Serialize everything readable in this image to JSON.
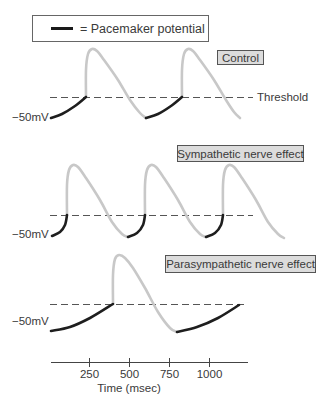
{
  "legend": {
    "label": "= Pacemaker potential",
    "swatch_color": "#1a1a1a"
  },
  "threshold_label": "Threshold",
  "colors": {
    "pacemaker": "#1e1e1e",
    "action_potential": "#c8c8c8",
    "threshold_dash": "#555555",
    "label_box_fill": "#dcdcdc",
    "label_box_stroke": "#555555",
    "axis": "#444444"
  },
  "panels": [
    {
      "title": "Control",
      "voltage_label": "−50mV",
      "label_box": {
        "x": 217,
        "y": 50,
        "w": 46,
        "h": 14
      },
      "voltage_label_y": 121,
      "threshold_y": 97,
      "threshold_x": [
        50,
        253
      ],
      "show_threshold_label": true,
      "pacemaker_segments": [
        [
          [
            51,
            118
          ],
          [
            62,
            114
          ],
          [
            75,
            106
          ],
          [
            86,
            97
          ]
        ],
        [
          [
            146,
            118
          ],
          [
            158,
            114
          ],
          [
            171,
            106
          ],
          [
            182,
            97
          ]
        ]
      ],
      "action_potentials": [
        [
          [
            86,
            97
          ],
          [
            86,
            70
          ],
          [
            88,
            54
          ],
          [
            92,
            49
          ],
          [
            97,
            51
          ],
          [
            104,
            60
          ],
          [
            118,
            80
          ],
          [
            130,
            100
          ],
          [
            140,
            113
          ],
          [
            146,
            118
          ]
        ],
        [
          [
            182,
            97
          ],
          [
            182,
            70
          ],
          [
            184,
            54
          ],
          [
            188,
            49
          ],
          [
            193,
            51
          ],
          [
            200,
            60
          ],
          [
            214,
            80
          ],
          [
            226,
            100
          ],
          [
            234,
            112
          ],
          [
            240,
            118
          ]
        ]
      ]
    },
    {
      "title": "Sympathetic nerve effect",
      "voltage_label": "−50mV",
      "label_box": {
        "x": 177,
        "y": 145,
        "w": 126,
        "h": 16
      },
      "voltage_label_y": 238,
      "threshold_y": 215,
      "threshold_x": [
        50,
        253
      ],
      "show_threshold_label": false,
      "pacemaker_segments": [
        [
          [
            52,
            236
          ],
          [
            60,
            232
          ],
          [
            65,
            225
          ],
          [
            67,
            215
          ]
        ],
        [
          [
            128,
            237
          ],
          [
            137,
            233
          ],
          [
            143,
            225
          ],
          [
            145,
            215
          ]
        ],
        [
          [
            206,
            237
          ],
          [
            215,
            233
          ],
          [
            221,
            225
          ],
          [
            223,
            215
          ]
        ]
      ],
      "action_potentials": [
        [
          [
            67,
            215
          ],
          [
            67,
            185
          ],
          [
            69,
            170
          ],
          [
            73,
            165
          ],
          [
            78,
            167
          ],
          [
            86,
            178
          ],
          [
            100,
            200
          ],
          [
            112,
            222
          ],
          [
            122,
            234
          ],
          [
            128,
            237
          ]
        ],
        [
          [
            145,
            215
          ],
          [
            145,
            185
          ],
          [
            147,
            170
          ],
          [
            151,
            165
          ],
          [
            156,
            167
          ],
          [
            164,
            178
          ],
          [
            178,
            200
          ],
          [
            190,
            222
          ],
          [
            200,
            234
          ],
          [
            206,
            237
          ]
        ],
        [
          [
            223,
            215
          ],
          [
            223,
            185
          ],
          [
            225,
            170
          ],
          [
            229,
            165
          ],
          [
            234,
            167
          ],
          [
            242,
            178
          ],
          [
            256,
            200
          ],
          [
            268,
            222
          ],
          [
            278,
            234
          ],
          [
            284,
            238
          ]
        ]
      ]
    },
    {
      "title": "Parasympathetic nerve effect",
      "voltage_label": "−50mV",
      "label_box": {
        "x": 165,
        "y": 255,
        "w": 150,
        "h": 17
      },
      "voltage_label_y": 325,
      "threshold_y": 304,
      "threshold_x": [
        50,
        248
      ],
      "show_threshold_label": false,
      "pacemaker_segments": [
        [
          [
            51,
            331
          ],
          [
            70,
            327
          ],
          [
            90,
            318
          ],
          [
            113,
            304
          ]
        ],
        [
          [
            177,
            332
          ],
          [
            197,
            327
          ],
          [
            218,
            318
          ],
          [
            239,
            305
          ]
        ]
      ],
      "action_potentials": [
        [
          [
            113,
            304
          ],
          [
            113,
            275
          ],
          [
            115,
            259
          ],
          [
            119,
            255
          ],
          [
            125,
            258
          ],
          [
            133,
            268
          ],
          [
            145,
            288
          ],
          [
            158,
            312
          ],
          [
            170,
            328
          ],
          [
            177,
            332
          ]
        ]
      ]
    }
  ],
  "x_axis": {
    "y": 362,
    "x_start": 51,
    "x_end": 248,
    "label": "Time (msec)",
    "ticks": [
      {
        "x": 89,
        "label": "250"
      },
      {
        "x": 129,
        "label": "500"
      },
      {
        "x": 169,
        "label": "750"
      },
      {
        "x": 209,
        "label": "1000"
      }
    ]
  },
  "chart_data": {
    "type": "line",
    "xlabel": "Time (msec)",
    "ylabel": "Membrane potential",
    "x_ticks": [
      250,
      500,
      750,
      1000
    ],
    "xlim": [
      0,
      1250
    ],
    "annotations": [
      "= Pacemaker potential",
      "Threshold",
      "−50mV"
    ],
    "series": [
      {
        "name": "Control",
        "action_potential_onsets_msec": [
          220,
          820
        ],
        "approx_rate": "~2 beats per 1200 msec"
      },
      {
        "name": "Sympathetic nerve effect",
        "action_potential_onsets_msec": [
          100,
          590,
          1080
        ],
        "approx_rate": "~3 beats per 1200 msec"
      },
      {
        "name": "Parasympathetic nerve effect",
        "action_potential_onsets_msec": [
          390
        ],
        "approx_rate": "~1 beat per 1200 msec"
      }
    ],
    "legend": [
      {
        "label": "Pacemaker potential",
        "style": "thick black line"
      }
    ]
  }
}
